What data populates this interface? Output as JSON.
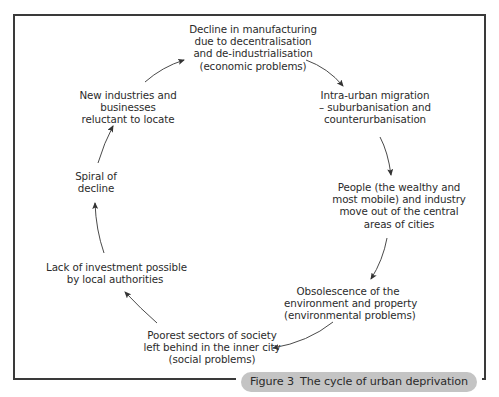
{
  "diagram": {
    "type": "cycle",
    "nodes": [
      {
        "id": "decline-manufacturing",
        "lines": [
          "Decline in manufacturing",
          "due to decentralisation",
          "and de-industrialisation",
          "(economic problems)"
        ]
      },
      {
        "id": "intra-urban-migration",
        "lines": [
          "Intra-urban migration",
          "– suburbanisation and",
          "counterurbanisation"
        ]
      },
      {
        "id": "people-move-out",
        "lines": [
          "People (the wealthy and",
          "most mobile) and industry",
          "move out of the central",
          "areas of cities"
        ]
      },
      {
        "id": "obsolescence",
        "lines": [
          "Obsolescence of the",
          "environment and property",
          "(environmental problems)"
        ]
      },
      {
        "id": "poorest-sectors",
        "lines": [
          "Poorest sectors of society",
          "left behind in the inner city",
          "(social problems)"
        ]
      },
      {
        "id": "lack-of-investment",
        "lines": [
          "Lack of investment possible",
          "by local authorities"
        ]
      },
      {
        "id": "spiral-of-decline",
        "lines": [
          "Spiral of",
          "decline"
        ]
      },
      {
        "id": "new-industries",
        "lines": [
          "New industries and",
          "businesses",
          "reluctant to locate"
        ]
      }
    ],
    "edges": [
      {
        "from": "decline-manufacturing",
        "to": "intra-urban-migration"
      },
      {
        "from": "intra-urban-migration",
        "to": "people-move-out"
      },
      {
        "from": "people-move-out",
        "to": "obsolescence"
      },
      {
        "from": "obsolescence",
        "to": "poorest-sectors"
      },
      {
        "from": "poorest-sectors",
        "to": "lack-of-investment"
      },
      {
        "from": "lack-of-investment",
        "to": "spiral-of-decline"
      },
      {
        "from": "spiral-of-decline",
        "to": "new-industries"
      },
      {
        "from": "new-industries",
        "to": "decline-manufacturing"
      }
    ]
  },
  "caption": {
    "figure_number": "Figure 3",
    "title": "The cycle of urban deprivation"
  },
  "colors": {
    "border": "#3a3a3a",
    "text": "#2b2b2b",
    "caption_bg": "#c4c4c4",
    "arrow": "#333333"
  }
}
